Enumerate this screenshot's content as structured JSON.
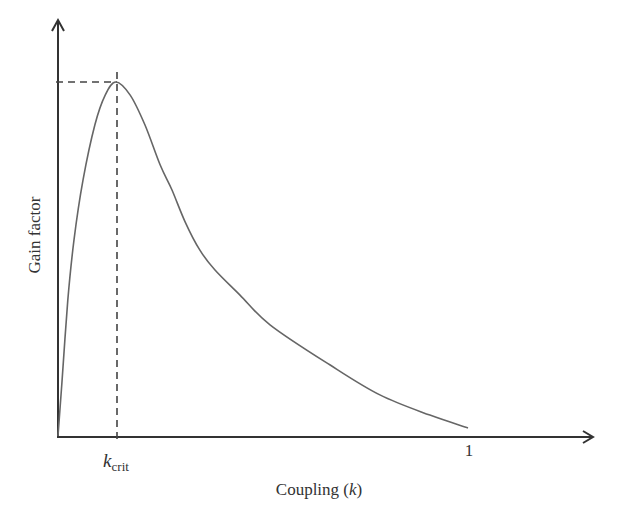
{
  "chart_data": {
    "type": "line",
    "title": "",
    "xlabel": "Coupling (k)",
    "xlabel_parts": {
      "prefix": "Coupling (",
      "var": "k",
      "suffix": ")"
    },
    "ylabel": "Gain factor",
    "x_ticks": [
      {
        "value": 0.14,
        "label": "k_crit",
        "label_main": "k",
        "label_sub": "crit"
      },
      {
        "value": 1.0,
        "label": "1"
      }
    ],
    "y_ticks": [],
    "xlim": [
      0,
      1.3
    ],
    "ylim": [
      0,
      1.15
    ],
    "grid": false,
    "legend": null,
    "annotations": [
      {
        "type": "dashed-vertical",
        "x": 0.14,
        "from_y": 0,
        "to_y": 1.03,
        "meaning": "critical coupling k_crit"
      },
      {
        "type": "dashed-horizontal",
        "y": 1.0,
        "from_x": 0,
        "to_x": 0.14,
        "meaning": "maximum gain"
      }
    ],
    "series": [
      {
        "name": "Gain factor",
        "color": "#666666",
        "x": [
          0.0,
          0.01,
          0.024,
          0.039,
          0.061,
          0.09,
          0.115,
          0.141,
          0.176,
          0.212,
          0.249,
          0.278,
          0.31,
          0.346,
          0.383,
          0.444,
          0.517,
          0.663,
          0.785,
          0.907,
          1.0
        ],
        "y": [
          0.0,
          0.158,
          0.384,
          0.554,
          0.723,
          0.879,
          0.963,
          1.0,
          0.963,
          0.879,
          0.766,
          0.695,
          0.605,
          0.525,
          0.469,
          0.398,
          0.314,
          0.201,
          0.116,
          0.059,
          0.023
        ]
      }
    ]
  },
  "axes": {
    "y_label": "Gain factor",
    "x_label_prefix": "Coupling (",
    "x_label_var": "k",
    "x_label_suffix": ")",
    "kcrit_main": "k",
    "kcrit_sub": "crit",
    "tick_one": "1"
  },
  "colors": {
    "axis": "#333333",
    "curve": "#6e6e6e",
    "dashed": "#444444"
  }
}
